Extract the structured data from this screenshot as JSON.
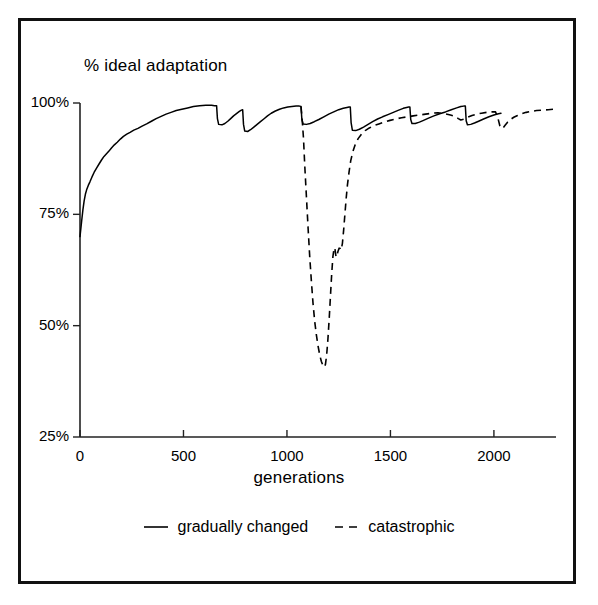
{
  "figure": {
    "border_color": "#111111",
    "background": "#ffffff",
    "line_color": "#000000"
  },
  "chart_data": {
    "type": "line",
    "title": "",
    "subtitle": "",
    "xlabel": "generations",
    "ylabel": "% ideal adaptation",
    "xlim": [
      0,
      2300
    ],
    "ylim": [
      25,
      100
    ],
    "xticks": [
      0,
      500,
      1000,
      1500,
      2000
    ],
    "xtick_labels": [
      "0",
      "500",
      "1000",
      "1500",
      "2000"
    ],
    "yticks": [
      25,
      50,
      75,
      100
    ],
    "ytick_labels": [
      "25%",
      "50%",
      "75%",
      "100%"
    ],
    "grid": false,
    "legend_position": "bottom-center",
    "series": [
      {
        "name": "gradually changed",
        "style": "solid",
        "color": "#000000",
        "points": [
          [
            0,
            70.0
          ],
          [
            8,
            73.5
          ],
          [
            14,
            76.0
          ],
          [
            20,
            78.0
          ],
          [
            26,
            79.5
          ],
          [
            32,
            80.5
          ],
          [
            40,
            81.5
          ],
          [
            48,
            82.3
          ],
          [
            58,
            83.4
          ],
          [
            68,
            84.4
          ],
          [
            80,
            85.4
          ],
          [
            92,
            86.3
          ],
          [
            104,
            87.2
          ],
          [
            116,
            88.0
          ],
          [
            128,
            88.6
          ],
          [
            140,
            89.2
          ],
          [
            152,
            89.9
          ],
          [
            166,
            90.6
          ],
          [
            180,
            91.2
          ],
          [
            195,
            91.9
          ],
          [
            210,
            92.5
          ],
          [
            226,
            93.0
          ],
          [
            242,
            93.4
          ],
          [
            260,
            93.9
          ],
          [
            280,
            94.3
          ],
          [
            300,
            94.8
          ],
          [
            322,
            95.3
          ],
          [
            345,
            95.9
          ],
          [
            368,
            96.5
          ],
          [
            392,
            97.0
          ],
          [
            416,
            97.5
          ],
          [
            440,
            97.9
          ],
          [
            465,
            98.3
          ],
          [
            492,
            98.6
          ],
          [
            520,
            98.9
          ],
          [
            548,
            99.2
          ],
          [
            578,
            99.4
          ],
          [
            608,
            99.5
          ],
          [
            636,
            99.5
          ],
          [
            650,
            99.4
          ],
          [
            660,
            99.4
          ],
          [
            664,
            96.5
          ],
          [
            670,
            95.2
          ],
          [
            686,
            95.1
          ],
          [
            700,
            95.4
          ],
          [
            714,
            95.9
          ],
          [
            728,
            96.5
          ],
          [
            742,
            97.1
          ],
          [
            756,
            97.6
          ],
          [
            770,
            98.1
          ],
          [
            780,
            98.4
          ],
          [
            786,
            98.5
          ],
          [
            790,
            95.2
          ],
          [
            796,
            93.7
          ],
          [
            810,
            93.6
          ],
          [
            824,
            94.0
          ],
          [
            840,
            94.6
          ],
          [
            856,
            95.2
          ],
          [
            872,
            95.8
          ],
          [
            888,
            96.4
          ],
          [
            906,
            97.1
          ],
          [
            924,
            97.7
          ],
          [
            944,
            98.2
          ],
          [
            964,
            98.6
          ],
          [
            984,
            98.9
          ],
          [
            1004,
            99.1
          ],
          [
            1024,
            99.2
          ],
          [
            1044,
            99.3
          ],
          [
            1060,
            99.3
          ],
          [
            1068,
            99.2
          ],
          [
            1072,
            96.3
          ],
          [
            1078,
            95.3
          ],
          [
            1094,
            95.2
          ],
          [
            1112,
            95.4
          ],
          [
            1132,
            95.8
          ],
          [
            1154,
            96.3
          ],
          [
            1178,
            96.9
          ],
          [
            1202,
            97.5
          ],
          [
            1226,
            98.0
          ],
          [
            1250,
            98.5
          ],
          [
            1272,
            98.8
          ],
          [
            1290,
            99.0
          ],
          [
            1300,
            99.1
          ],
          [
            1306,
            99.1
          ],
          [
            1310,
            95.6
          ],
          [
            1316,
            93.9
          ],
          [
            1332,
            93.8
          ],
          [
            1350,
            94.1
          ],
          [
            1370,
            94.6
          ],
          [
            1392,
            95.2
          ],
          [
            1414,
            95.8
          ],
          [
            1438,
            96.4
          ],
          [
            1462,
            96.9
          ],
          [
            1488,
            97.4
          ],
          [
            1514,
            97.9
          ],
          [
            1540,
            98.4
          ],
          [
            1562,
            98.8
          ],
          [
            1578,
            99.0
          ],
          [
            1588,
            99.1
          ],
          [
            1594,
            99.1
          ],
          [
            1598,
            96.3
          ],
          [
            1604,
            95.4
          ],
          [
            1620,
            95.4
          ],
          [
            1640,
            95.7
          ],
          [
            1660,
            96.1
          ],
          [
            1684,
            96.6
          ],
          [
            1710,
            97.1
          ],
          [
            1738,
            97.6
          ],
          [
            1766,
            98.0
          ],
          [
            1794,
            98.5
          ],
          [
            1820,
            98.9
          ],
          [
            1840,
            99.2
          ],
          [
            1854,
            99.3
          ],
          [
            1862,
            99.3
          ],
          [
            1866,
            96.0
          ],
          [
            1872,
            95.1
          ],
          [
            1888,
            95.2
          ],
          [
            1906,
            95.5
          ],
          [
            1926,
            95.9
          ],
          [
            1950,
            96.4
          ],
          [
            1976,
            96.9
          ],
          [
            2000,
            97.3
          ],
          [
            2022,
            97.6
          ],
          [
            2034,
            97.7
          ]
        ]
      },
      {
        "name": "catastrophic",
        "style": "dashed",
        "color": "#000000",
        "points": [
          [
            1068,
            99.2
          ],
          [
            1074,
            96.0
          ],
          [
            1080,
            92.0
          ],
          [
            1086,
            86.0
          ],
          [
            1094,
            79.0
          ],
          [
            1102,
            72.0
          ],
          [
            1110,
            65.5
          ],
          [
            1118,
            60.0
          ],
          [
            1126,
            55.0
          ],
          [
            1134,
            51.0
          ],
          [
            1142,
            48.0
          ],
          [
            1150,
            45.5
          ],
          [
            1158,
            43.5
          ],
          [
            1166,
            42.0
          ],
          [
            1174,
            41.0
          ],
          [
            1180,
            40.7
          ],
          [
            1186,
            41.3
          ],
          [
            1192,
            43.5
          ],
          [
            1198,
            47.0
          ],
          [
            1204,
            51.5
          ],
          [
            1210,
            56.5
          ],
          [
            1216,
            61.5
          ],
          [
            1222,
            65.5
          ],
          [
            1228,
            67.5
          ],
          [
            1232,
            67.2
          ],
          [
            1236,
            65.8
          ],
          [
            1240,
            65.4
          ],
          [
            1246,
            66.6
          ],
          [
            1252,
            67.4
          ],
          [
            1258,
            67.3
          ],
          [
            1262,
            67.0
          ],
          [
            1268,
            68.5
          ],
          [
            1274,
            71.5
          ],
          [
            1280,
            75.0
          ],
          [
            1286,
            78.5
          ],
          [
            1292,
            81.5
          ],
          [
            1300,
            84.5
          ],
          [
            1308,
            87.0
          ],
          [
            1318,
            89.0
          ],
          [
            1330,
            90.7
          ],
          [
            1344,
            92.0
          ],
          [
            1360,
            93.0
          ],
          [
            1378,
            93.8
          ],
          [
            1398,
            94.4
          ],
          [
            1420,
            94.9
          ],
          [
            1444,
            95.3
          ],
          [
            1470,
            95.7
          ],
          [
            1498,
            96.1
          ],
          [
            1526,
            96.4
          ],
          [
            1554,
            96.7
          ],
          [
            1582,
            96.9
          ],
          [
            1610,
            97.1
          ],
          [
            1640,
            97.3
          ],
          [
            1670,
            97.5
          ],
          [
            1700,
            97.7
          ],
          [
            1730,
            97.8
          ],
          [
            1760,
            97.6
          ],
          [
            1790,
            97.3
          ],
          [
            1812,
            97.0
          ],
          [
            1828,
            96.5
          ],
          [
            1840,
            96.2
          ],
          [
            1856,
            96.4
          ],
          [
            1874,
            96.8
          ],
          [
            1894,
            97.2
          ],
          [
            1916,
            97.5
          ],
          [
            1940,
            97.7
          ],
          [
            1966,
            97.9
          ],
          [
            1990,
            98.0
          ],
          [
            2008,
            98.0
          ],
          [
            2020,
            96.5
          ],
          [
            2028,
            95.0
          ],
          [
            2036,
            94.3
          ],
          [
            2044,
            94.4
          ],
          [
            2054,
            95.0
          ],
          [
            2066,
            95.7
          ],
          [
            2080,
            96.3
          ],
          [
            2096,
            96.8
          ],
          [
            2114,
            97.2
          ],
          [
            2134,
            97.6
          ],
          [
            2156,
            97.9
          ],
          [
            2180,
            98.1
          ],
          [
            2206,
            98.3
          ],
          [
            2234,
            98.4
          ],
          [
            2262,
            98.5
          ],
          [
            2290,
            98.6
          ]
        ]
      }
    ]
  },
  "legend": {
    "entries": [
      {
        "label": "gradually changed",
        "style": "solid"
      },
      {
        "label": "catastrophic",
        "style": "dashed"
      }
    ]
  }
}
